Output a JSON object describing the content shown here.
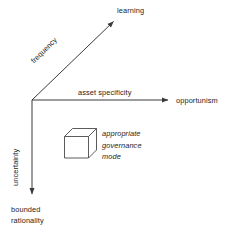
{
  "diagram": {
    "background_color": "#ffffff",
    "line_color": "#3a3a3a",
    "text_color": "#1d1d1d",
    "axes": [
      {
        "id": "frequency",
        "axis_label": "frequency",
        "endpoint_label": "learning",
        "direction": "diagonal-up-right"
      },
      {
        "id": "asset-specificity",
        "axis_label": "asset specificity",
        "endpoint_label": "opportunism",
        "direction": "right"
      },
      {
        "id": "uncertainty",
        "axis_label": "uncertainty",
        "endpoint_label_line1": "bounded",
        "endpoint_label_line2": "rationality",
        "direction": "down"
      }
    ],
    "cube": {
      "caption_line1": "appropriate",
      "caption_line2": "governance",
      "caption_line3": "mode"
    }
  }
}
